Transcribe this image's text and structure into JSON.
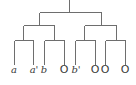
{
  "diagram": {
    "type": "binary-tree",
    "edge_color": "#6e6e6e",
    "leaves": [
      {
        "label": "a",
        "x": 14,
        "style": "italic"
      },
      {
        "label": "a'",
        "x": 33,
        "style": "italic"
      },
      {
        "label": "b",
        "x": 44,
        "style": "italic"
      },
      {
        "label": "O",
        "x": 64,
        "style": "circle"
      },
      {
        "label": "b'",
        "x": 75,
        "style": "italic"
      },
      {
        "label": "O",
        "x": 95,
        "style": "circle"
      },
      {
        "label": "O",
        "x": 105,
        "style": "circle"
      },
      {
        "label": "O",
        "x": 125,
        "style": "circle"
      }
    ]
  }
}
